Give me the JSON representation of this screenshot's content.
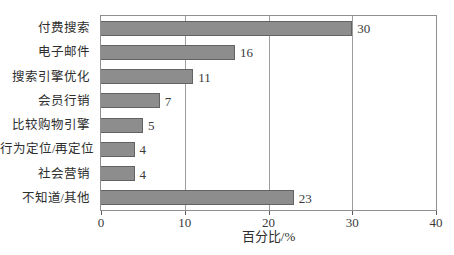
{
  "figure": {
    "background": "#ffffff",
    "bar_fill": "#8d8d8d",
    "bar_border": "#636363",
    "grid_color": "#9d9d9d",
    "plot_border": "#8f8f8f",
    "text_color": "#2e2e2e"
  },
  "chart_data": {
    "type": "bar",
    "orientation": "horizontal",
    "title": "",
    "xlabel": "百分比/%",
    "ylabel": "",
    "categories": [
      "付费搜索",
      "电子邮件",
      "搜索引擎优化",
      "会员行销",
      "比较购物引擎",
      "行为定位/再定位",
      "社会营销",
      "不知道/其他"
    ],
    "values": [
      30,
      16,
      11,
      7,
      5,
      4,
      4,
      23
    ],
    "value_labels": [
      "30",
      "16",
      "11",
      "7",
      "5",
      "4",
      "4",
      "23"
    ],
    "xlim": [
      0,
      40
    ],
    "xticks": [
      0,
      10,
      20,
      30,
      40
    ],
    "xtick_labels": [
      "0",
      "10",
      "20",
      "30",
      "40"
    ],
    "grid": true,
    "legend": false
  }
}
